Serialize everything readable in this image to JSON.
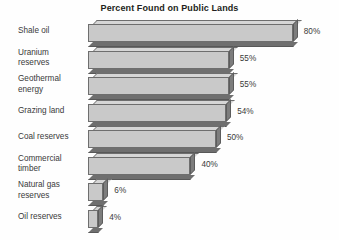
{
  "chart_data": {
    "type": "bar",
    "orientation": "horizontal",
    "title": "Percent Found on Public Lands",
    "xlabel": "",
    "ylabel": "",
    "xlim": [
      0,
      80
    ],
    "grid": false,
    "legend": false,
    "value_suffix": "%",
    "categories": [
      "Shale oil",
      "Uranium reserves",
      "Geothermal energy",
      "Grazing land",
      "Coal reserves",
      "Commercial timber",
      "Natural gas reserves",
      "Oil reserves"
    ],
    "values": [
      80,
      55,
      55,
      54,
      50,
      40,
      6,
      4
    ],
    "value_labels": [
      "80%",
      "55%",
      "55%",
      "54%",
      "50%",
      "40%",
      "6%",
      "4%"
    ],
    "colors": {
      "bar_face": "#c9c9c9",
      "bar_top": "#d6d6d6",
      "bar_shadow": "#6f6f6f",
      "bar_outline": "#6e6e6e",
      "text": "#3a3a3a",
      "title_text": "#231f20",
      "background": "#fefefe"
    }
  },
  "rows": [
    {
      "label": "Shale oil",
      "value_label": "80%",
      "label_lines": "Shale oil"
    },
    {
      "label": "Uranium reserves",
      "value_label": "55%",
      "label_lines": "Uranium\nreserves"
    },
    {
      "label": "Geothermal energy",
      "value_label": "55%",
      "label_lines": "Geothermal\nenergy"
    },
    {
      "label": "Grazing land",
      "value_label": "54%",
      "label_lines": "Grazing land"
    },
    {
      "label": "Coal reserves",
      "value_label": "50%",
      "label_lines": "Coal reserves"
    },
    {
      "label": "Commercial timber",
      "value_label": "40%",
      "label_lines": "Commercial\ntimber"
    },
    {
      "label": "Natural gas reserves",
      "value_label": "6%",
      "label_lines": "Natural gas\nreserves"
    },
    {
      "label": "Oil reserves",
      "value_label": "4%",
      "label_lines": "Oil reserves"
    }
  ]
}
